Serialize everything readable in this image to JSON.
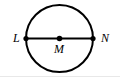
{
  "figure": {
    "type": "geometry-diagram",
    "background_color": "#ffffff",
    "stroke_color": "#000000",
    "bottom_rule_color": "#e8e8e8",
    "circle": {
      "center_x": 59.5,
      "center_y": 38.5,
      "radius": 33.5,
      "stroke_width": 2
    },
    "diameter": {
      "from_x": 26,
      "from_y": 38.5,
      "to_x": 93,
      "to_y": 38.5,
      "stroke_width": 2
    },
    "points": [
      {
        "id": "L",
        "label": "L",
        "x": 26,
        "y": 38.5,
        "radius": 2.6,
        "role": "endpoint-on-circle"
      },
      {
        "id": "M",
        "label": "M",
        "x": 59.5,
        "y": 38.5,
        "radius": 2.8,
        "role": "center"
      },
      {
        "id": "N",
        "label": "N",
        "x": 93,
        "y": 38.5,
        "radius": 2.6,
        "role": "endpoint-on-circle"
      }
    ],
    "labels": {
      "left": "L",
      "center": "M",
      "right": "N"
    }
  }
}
